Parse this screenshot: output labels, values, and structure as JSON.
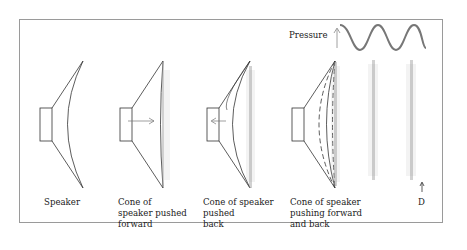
{
  "diagram": {
    "pressure_label": "Pressure",
    "distance_label": "D",
    "panels": [
      {
        "id": "speaker",
        "caption": "Speaker"
      },
      {
        "id": "pushed-forward",
        "caption": "Cone of\nspeaker pushed\nforward"
      },
      {
        "id": "pushed-back",
        "caption": "Cone of speaker\npushed\nback"
      },
      {
        "id": "forward-and-back",
        "caption": "Cone of speaker\npushing forward\nand back"
      }
    ],
    "colors": {
      "line": "#333333",
      "frame": "#9a9a9a",
      "wave": "#777777",
      "dots": "#888888"
    }
  }
}
